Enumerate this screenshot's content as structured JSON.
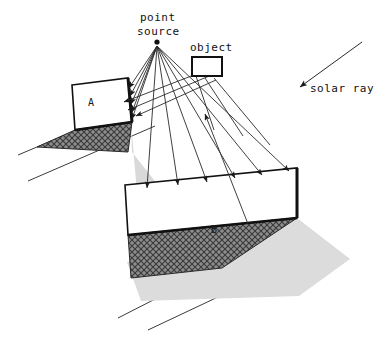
{
  "figure": {
    "title": "",
    "background_color": "#ffffff",
    "line_color": "#1a1a1a",
    "dark_shadow_color": "#6e6e6e",
    "light_shadow_color": "#d8d8d8"
  },
  "labels": {
    "point_source_line1": "point",
    "point_source_line2": "source",
    "object": "object",
    "solar_ray": "solar ray",
    "panel_a": "A",
    "panel_b": "B"
  },
  "elements": {
    "point_source_dot": {
      "cx": 157,
      "cy": 42,
      "r": 2.6
    },
    "object_rect": {
      "x": 192,
      "y": 57,
      "w": 30,
      "h": 19
    },
    "panel_a": {
      "points": "72,85 128,78 132,122 75,130",
      "label_x": 92,
      "label_y": 104
    },
    "panel_b": {
      "points": "125,185 297,168 297,218 128,235",
      "label_x": 214,
      "label_y": 231
    },
    "shadow_a_dark": {
      "points": "75,130 132,122 128,152 37,147"
    },
    "shadow_a_light": {
      "points": "132,122 131,152 175,206 139,203"
    },
    "shadow_b_dark": {
      "points": "128,235 297,218 220,268 131,277"
    },
    "shadow_b_light": {
      "points": "297,218 348,258 296,295 140,300 128,262"
    },
    "solar_ray_arrow": {
      "x1": 360,
      "y1": 44,
      "x2": 299,
      "y2": 88
    }
  },
  "rays_to_a": [
    {
      "x1": 157,
      "y1": 45,
      "x2": 130,
      "y2": 89
    },
    {
      "x1": 157,
      "y1": 45,
      "x2": 131,
      "y2": 97
    },
    {
      "x1": 157,
      "y1": 45,
      "x2": 132,
      "y2": 105
    },
    {
      "x1": 157,
      "y1": 45,
      "x2": 132,
      "y2": 113
    },
    {
      "x1": 157,
      "y1": 45,
      "x2": 132,
      "y2": 120
    }
  ],
  "rays_to_b": [
    {
      "x1": 157,
      "y1": 45,
      "x2": 147,
      "y2": 189
    },
    {
      "x1": 157,
      "y1": 45,
      "x2": 178,
      "y2": 186
    },
    {
      "x1": 157,
      "y1": 45,
      "x2": 206,
      "y2": 182
    },
    {
      "x1": 157,
      "y1": 45,
      "x2": 234,
      "y2": 179
    },
    {
      "x1": 157,
      "y1": 45,
      "x2": 261,
      "y2": 176
    },
    {
      "x1": 157,
      "y1": 45,
      "x2": 288,
      "y2": 172
    }
  ],
  "rays_through_object": [
    {
      "x1": 197,
      "y1": 72,
      "x2": 128,
      "y2": 103
    },
    {
      "x1": 202,
      "y1": 74,
      "x2": 131,
      "y2": 109
    },
    {
      "x1": 208,
      "y1": 70,
      "x2": 136,
      "y2": 112
    }
  ],
  "reflected_ray": {
    "x1": 247,
    "y1": 222,
    "x2": 205,
    "y2": 116
  },
  "object_bottom_rays": [
    {
      "x1": 200,
      "y1": 76,
      "x2": 212,
      "y2": 127
    },
    {
      "x1": 212,
      "y1": 76,
      "x2": 241,
      "y2": 133
    },
    {
      "x1": 220,
      "y1": 76,
      "x2": 266,
      "y2": 140
    }
  ],
  "ground_lines": [
    {
      "x1": 18,
      "y1": 155,
      "x2": 120,
      "y2": 112
    },
    {
      "x1": 28,
      "y1": 181,
      "x2": 155,
      "y2": 126
    },
    {
      "x1": 118,
      "y1": 318,
      "x2": 208,
      "y2": 272
    },
    {
      "x1": 148,
      "y1": 330,
      "x2": 235,
      "y2": 288
    }
  ]
}
